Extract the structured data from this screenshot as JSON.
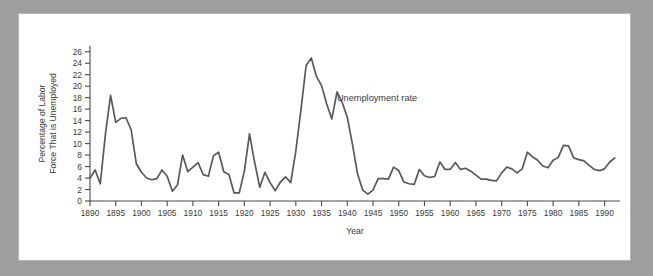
{
  "figure": {
    "background_color": "#9e9e9e",
    "panel_color": "#ffffff",
    "border_color": "#b8b8b8"
  },
  "chart_data": {
    "type": "line",
    "title": "",
    "subtitle": "",
    "xlabel": "Year",
    "ylabel": "Percentage of Labor Force That is Unemployed",
    "ylabel_line1": "Percentage of Labor",
    "ylabel_line2": "Force That is Unemployed",
    "annotations": [
      {
        "text": "Unemployment rate",
        "x": 1938,
        "y": 17.5
      }
    ],
    "legend": [],
    "legend_position": "none",
    "grid": false,
    "line_color": "#595959",
    "axis_color": "#4a4a4a",
    "text_color": "#3a3a3a",
    "xlim": [
      1890,
      1993
    ],
    "ylim": [
      0,
      27
    ],
    "xticks": [
      1890,
      1895,
      1900,
      1905,
      1910,
      1915,
      1920,
      1925,
      1930,
      1935,
      1940,
      1945,
      1950,
      1955,
      1960,
      1965,
      1970,
      1975,
      1980,
      1985,
      1990
    ],
    "xtick_labels": [
      "1890",
      "1895",
      "1900",
      "1905",
      "1910",
      "1915",
      "1920",
      "1925",
      "1930",
      "1935",
      "1940",
      "1945",
      "1950",
      "1955",
      "1960",
      "1965",
      "1970",
      "1975",
      "1980",
      "1985",
      "1990"
    ],
    "yticks": [
      0,
      2,
      4,
      6,
      8,
      10,
      12,
      14,
      16,
      18,
      20,
      22,
      24,
      26
    ],
    "ytick_labels": [
      "0",
      "2",
      "4",
      "6",
      "8",
      "10",
      "12",
      "14",
      "16",
      "18",
      "20",
      "22",
      "24",
      "26"
    ],
    "series": [
      {
        "name": "Unemployment rate",
        "x": [
          1890,
          1891,
          1892,
          1893,
          1894,
          1895,
          1896,
          1897,
          1898,
          1899,
          1900,
          1901,
          1902,
          1903,
          1904,
          1905,
          1906,
          1907,
          1908,
          1909,
          1910,
          1911,
          1912,
          1913,
          1914,
          1915,
          1916,
          1917,
          1918,
          1919,
          1920,
          1921,
          1922,
          1923,
          1924,
          1925,
          1926,
          1927,
          1928,
          1929,
          1930,
          1931,
          1932,
          1933,
          1934,
          1935,
          1936,
          1937,
          1938,
          1939,
          1940,
          1941,
          1942,
          1943,
          1944,
          1945,
          1946,
          1947,
          1948,
          1949,
          1950,
          1951,
          1952,
          1953,
          1954,
          1955,
          1956,
          1957,
          1958,
          1959,
          1960,
          1961,
          1962,
          1963,
          1964,
          1965,
          1966,
          1967,
          1968,
          1969,
          1970,
          1971,
          1972,
          1973,
          1974,
          1975,
          1976,
          1977,
          1978,
          1979,
          1980,
          1981,
          1982,
          1983,
          1984,
          1985,
          1986,
          1987,
          1988,
          1989,
          1990,
          1991,
          1992
        ],
        "values": [
          4.0,
          5.4,
          3.0,
          11.7,
          18.4,
          13.7,
          14.4,
          14.5,
          12.4,
          6.5,
          5.0,
          4.0,
          3.7,
          3.9,
          5.4,
          4.3,
          1.7,
          2.8,
          8.0,
          5.1,
          5.9,
          6.7,
          4.6,
          4.3,
          7.9,
          8.5,
          5.1,
          4.6,
          1.4,
          1.4,
          5.2,
          11.7,
          6.7,
          2.4,
          5.0,
          3.2,
          1.8,
          3.3,
          4.2,
          3.2,
          8.7,
          15.9,
          23.6,
          24.9,
          21.7,
          20.1,
          16.9,
          14.3,
          19.0,
          17.2,
          14.6,
          9.9,
          4.7,
          1.9,
          1.2,
          1.9,
          3.9,
          3.9,
          3.8,
          5.9,
          5.3,
          3.3,
          3.0,
          2.9,
          5.5,
          4.4,
          4.1,
          4.3,
          6.8,
          5.5,
          5.5,
          6.7,
          5.5,
          5.7,
          5.2,
          4.5,
          3.8,
          3.8,
          3.6,
          3.5,
          4.9,
          5.9,
          5.6,
          4.9,
          5.6,
          8.5,
          7.7,
          7.1,
          6.1,
          5.8,
          7.1,
          7.6,
          9.7,
          9.6,
          7.5,
          7.2,
          7.0,
          6.2,
          5.5,
          5.3,
          5.6,
          6.8,
          7.5
        ]
      }
    ]
  }
}
